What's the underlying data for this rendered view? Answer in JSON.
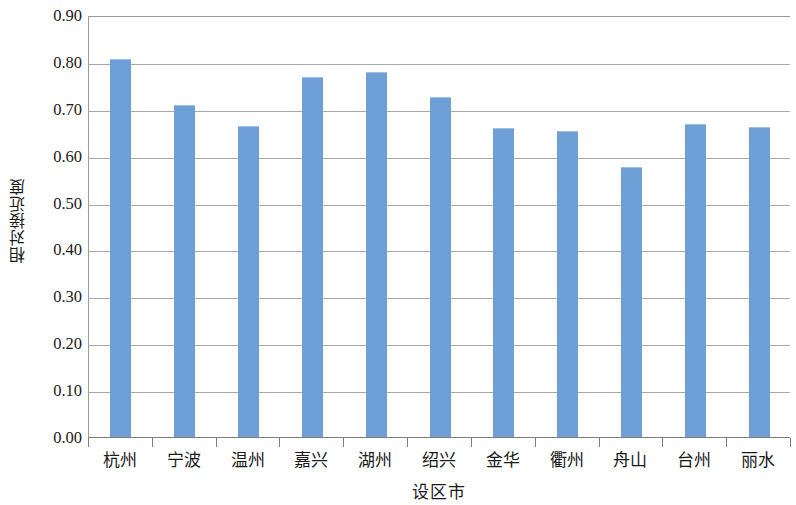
{
  "chart_data": {
    "type": "bar",
    "title": "",
    "subtitle": "",
    "xlabel": "设区市",
    "ylabel": "相对接近度",
    "categories": [
      "杭州",
      "宁波",
      "温州",
      "嘉兴",
      "湖州",
      "绍兴",
      "金华",
      "衢州",
      "舟山",
      "台州",
      "丽水"
    ],
    "values": [
      0.805,
      0.707,
      0.662,
      0.765,
      0.777,
      0.724,
      0.656,
      0.651,
      0.573,
      0.666,
      0.658
    ],
    "ylim": [
      0.0,
      0.9
    ],
    "ytick_values": [
      0.0,
      0.1,
      0.2,
      0.3,
      0.4,
      0.5,
      0.6,
      0.7,
      0.8,
      0.9
    ],
    "ytick_labels": [
      "0.00",
      "0.10",
      "0.20",
      "0.30",
      "0.40",
      "0.50",
      "0.60",
      "0.70",
      "0.80",
      "0.90"
    ],
    "grid": "horizontal",
    "legend": "none",
    "series": [
      {
        "name": "相对接近度",
        "color": "#6e9fd6",
        "values": [
          0.805,
          0.707,
          0.662,
          0.765,
          0.777,
          0.724,
          0.656,
          0.651,
          0.573,
          0.666,
          0.658
        ]
      }
    ],
    "bar_color": "#6e9fd6",
    "axis_color": "#7d7d7d",
    "gridline_color": "#a9a9a9"
  }
}
